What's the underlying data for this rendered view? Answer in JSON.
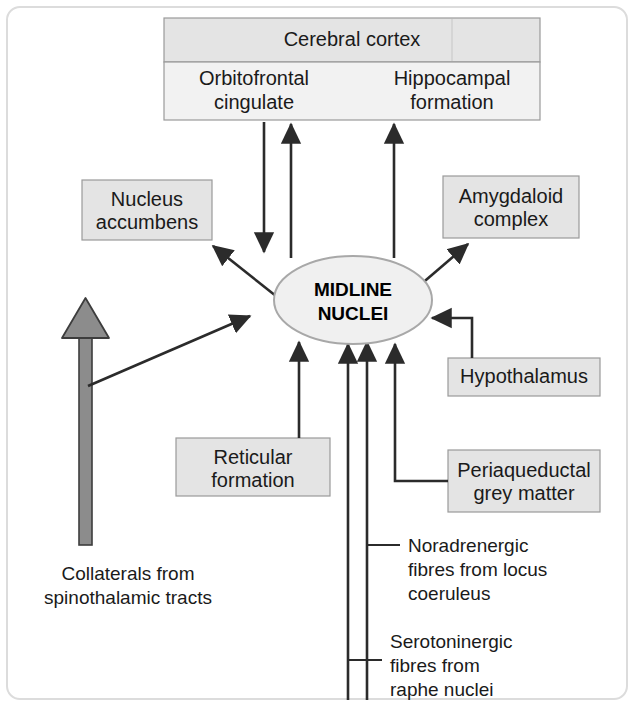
{
  "diagram": {
    "colors": {
      "box_fill": "#e4e4e4",
      "box_fill_light": "#f2f2f2",
      "box_stroke": "#9a9a9a",
      "arrow": "#2b2b2b",
      "gray_arrow": "#8c8c8c",
      "frame": "#dcdcdc",
      "text": "#1a1a1a"
    },
    "center_node": {
      "name": "midline-nuclei",
      "line1": "MIDLINE",
      "line2": "NUCLEI"
    },
    "cortex_box": {
      "header": "Cerebral cortex",
      "left_region_line1": "Orbitofrontal",
      "left_region_line2": "cingulate",
      "right_region_line1": "Hippocampal",
      "right_region_line2": "formation"
    },
    "boxes": [
      {
        "id": "nucleus-accumbens",
        "line1": "Nucleus",
        "line2": "accumbens"
      },
      {
        "id": "amygdaloid-complex",
        "line1": "Amygdaloid",
        "line2": "complex"
      },
      {
        "id": "hypothalamus",
        "line1": "Hypothalamus",
        "line2": ""
      },
      {
        "id": "periaqueductal-grey-matter",
        "line1": "Periaqueductal",
        "line2": "grey matter"
      },
      {
        "id": "reticular-formation",
        "line1": "Reticular",
        "line2": "formation"
      }
    ],
    "annotations": [
      {
        "id": "collaterals-spinothalamic",
        "line1": "Collaterals from",
        "line2": "spinothalamic tracts",
        "line3": ""
      },
      {
        "id": "noradrenergic-locus-coeruleus",
        "line1": "Noradrenergic",
        "line2": "fibres from locus",
        "line3": "coeruleus"
      },
      {
        "id": "serotoninergic-raphe-nuclei",
        "line1": "Serotoninergic",
        "line2": "fibres from",
        "line3": "raphe nuclei"
      }
    ]
  }
}
